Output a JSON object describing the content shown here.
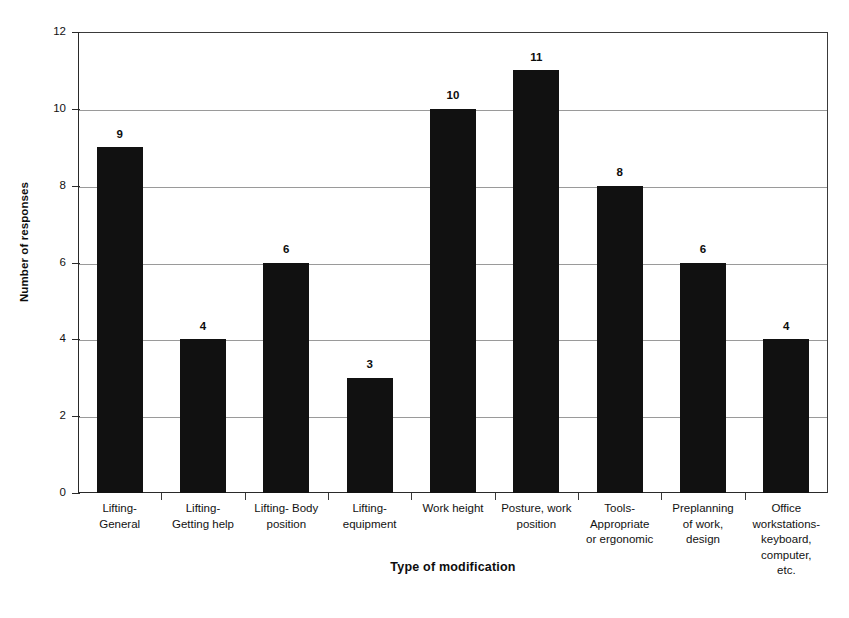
{
  "chart_data": {
    "type": "bar",
    "title": "",
    "xlabel": "Type of modification",
    "ylabel": "Number of responses",
    "ylim": [
      0,
      12
    ],
    "ytick_values": [
      0,
      2,
      4,
      6,
      8,
      10,
      12
    ],
    "ytick_labels": [
      "0",
      "2",
      "4",
      "6",
      "8",
      "10",
      "12"
    ],
    "grid": true,
    "grid_axis": "y",
    "legend": null,
    "bar_color": "#111111",
    "categories": [
      "Lifting-General",
      "Lifting-Getting help",
      "Lifting- Body position",
      "Lifting-equipment",
      "Work height",
      "Posture, work position",
      "Tools- Appropriate or ergonomic",
      "Preplanning of work, design",
      "Office workstations-keyboard, computer, etc."
    ],
    "category_lines": [
      [
        "Lifting-",
        "General"
      ],
      [
        "Lifting-",
        "Getting help"
      ],
      [
        "Lifting- Body",
        "position"
      ],
      [
        "Lifting-",
        "equipment"
      ],
      [
        "Work height"
      ],
      [
        "Posture, work",
        "position"
      ],
      [
        "Tools-",
        "Appropriate",
        "or  ergonomic"
      ],
      [
        "Preplanning",
        "of work,",
        "design"
      ],
      [
        "Office",
        "workstations-",
        "keyboard,",
        "computer,",
        "etc."
      ]
    ],
    "values": [
      9,
      4,
      6,
      3,
      10,
      11,
      8,
      6,
      4
    ],
    "value_labels": [
      "9",
      "4",
      "6",
      "3",
      "10",
      "11",
      "8",
      "6",
      "4"
    ]
  }
}
